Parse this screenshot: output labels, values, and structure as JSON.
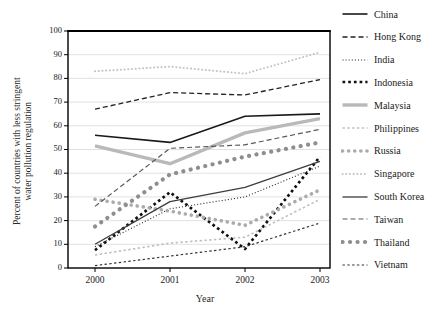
{
  "chart_data": {
    "type": "line",
    "title": "",
    "xlabel": "Year",
    "ylabel": "Percent of countries with less stringent water pollution regulation",
    "x": [
      "2000",
      "2001",
      "2002",
      "2003"
    ],
    "ylim": [
      0,
      100
    ],
    "yticks": [
      0,
      10,
      20,
      30,
      40,
      50,
      60,
      70,
      80,
      90,
      100
    ],
    "grid": "horizontal",
    "legend_position": "right",
    "axis_color": "#000000",
    "gridline_color": "#d9d9d9",
    "series": [
      {
        "name": "China",
        "values": [
          56,
          53,
          64,
          65
        ],
        "color": "#1a1a1a",
        "pattern": "solid",
        "width": 1.6
      },
      {
        "name": "Hong Kong",
        "values": [
          67,
          74,
          73,
          79.5
        ],
        "color": "#222222",
        "pattern": "dash",
        "width": 1.3
      },
      {
        "name": "India",
        "values": [
          9,
          25,
          30,
          43
        ],
        "color": "#222222",
        "pattern": "fine-dot",
        "width": 1.1
      },
      {
        "name": "Indonesia",
        "values": [
          7.5,
          32,
          8,
          47
        ],
        "color": "#111111",
        "pattern": "bold-dot",
        "width": 2.7
      },
      {
        "name": "Malaysia",
        "values": [
          51.5,
          44,
          57,
          63
        ],
        "color": "#b9b9b9",
        "pattern": "solid",
        "width": 3.4
      },
      {
        "name": "Philippines",
        "values": [
          5.5,
          10.5,
          13,
          29
        ],
        "color": "#bfbfbf",
        "pattern": "dash-small",
        "width": 1.6
      },
      {
        "name": "Russia",
        "values": [
          29,
          24,
          18,
          33
        ],
        "color": "#ababab",
        "pattern": "round-dot",
        "width": 3.6
      },
      {
        "name": "Singapore",
        "values": [
          83,
          85,
          82,
          91
        ],
        "color": "#c3c3c3",
        "pattern": "dot",
        "width": 2.0
      },
      {
        "name": "South Korea",
        "values": [
          10,
          28,
          34,
          45
        ],
        "color": "#3c3c3c",
        "pattern": "solid",
        "width": 1.3
      },
      {
        "name": "Taiwan",
        "values": [
          26,
          50.5,
          52,
          58.5
        ],
        "color": "#5a5a5a",
        "pattern": "dash",
        "width": 1.2
      },
      {
        "name": "Thailand",
        "values": [
          17.5,
          39.5,
          47,
          53
        ],
        "color": "#8e8e8e",
        "pattern": "big-round-dot",
        "width": 4.2
      },
      {
        "name": "Vietnam",
        "values": [
          1,
          5,
          9,
          19
        ],
        "color": "#333333",
        "pattern": "dash-small",
        "width": 1.2
      }
    ]
  }
}
